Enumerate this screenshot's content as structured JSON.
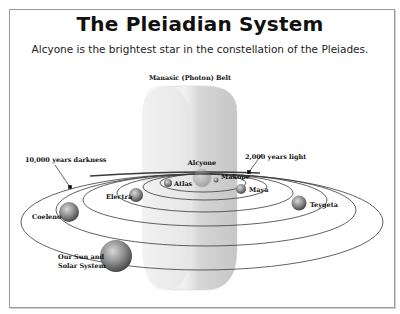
{
  "title": "The Pleiadian System",
  "subtitle": "Alcyone is the brightest star in the constellation of the Pleiades.",
  "labels": {
    "belt": "Manasic (Photon) Belt",
    "darkness": "10,000 years darkness",
    "light": "2,000 years light",
    "alcyone": "Alcyone",
    "makope": "Makope",
    "atlas": "Atlas",
    "maya": "Maya",
    "electra": "Electra",
    "teygeta": "Teygeta",
    "coeleno": "Coeleno",
    "sun_line1": "Our Sun and",
    "sun_line2": "Solar System"
  },
  "colors": {
    "orbit": "#3a3a3a",
    "belt_fill": "#e6e6e6",
    "belt_shade": "#cfcfcf",
    "star": "#8a8a8a",
    "frame": "#9a9a9a"
  }
}
